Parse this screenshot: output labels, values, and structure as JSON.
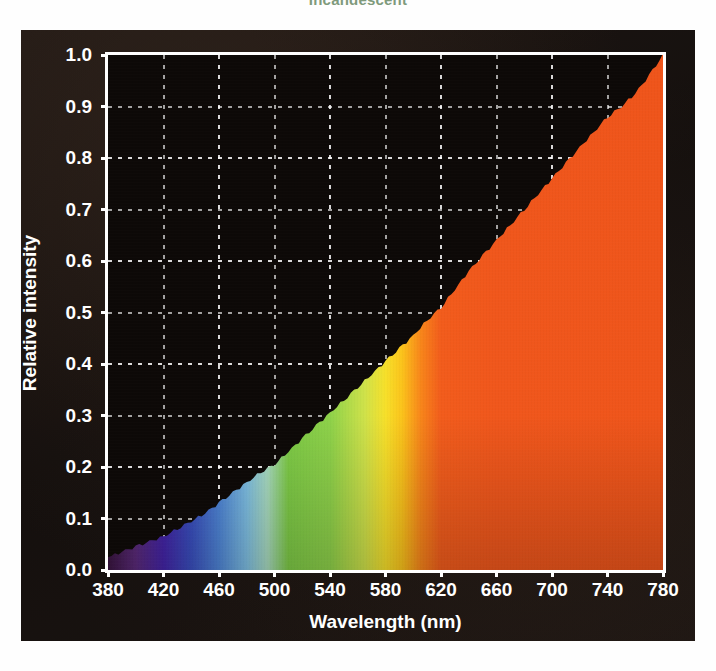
{
  "title": "Incandescent",
  "colors": {
    "panel_background": "#171210",
    "plot_background": "#0d0907",
    "axis": "#ffffff",
    "grid": "#ffffff",
    "title_text": "#7f9a7c",
    "orange_fill": "#F0571C"
  },
  "axes": {
    "x_label": "Wavelength (nm)",
    "y_label": "Relative intensity",
    "x_ticks": [
      380,
      420,
      460,
      500,
      540,
      580,
      620,
      660,
      700,
      740,
      780
    ],
    "y_ticks": [
      "0.0",
      "0.1",
      "0.2",
      "0.3",
      "0.4",
      "0.5",
      "0.6",
      "0.7",
      "0.8",
      "0.9",
      "1.0"
    ]
  },
  "chart_data": {
    "type": "area",
    "title": "Incandescent",
    "xlabel": "Wavelength (nm)",
    "ylabel": "Relative intensity",
    "xlim": [
      380,
      780
    ],
    "ylim": [
      0.0,
      1.0
    ],
    "grid": true,
    "legend": "none",
    "fill_style": "visible-spectrum-gradient",
    "x": [
      380,
      390,
      400,
      410,
      420,
      430,
      440,
      450,
      460,
      470,
      480,
      490,
      500,
      510,
      520,
      530,
      540,
      550,
      560,
      570,
      580,
      590,
      600,
      610,
      620,
      630,
      640,
      650,
      660,
      670,
      680,
      690,
      700,
      710,
      720,
      730,
      740,
      750,
      760,
      770,
      780
    ],
    "y": [
      0.025,
      0.035,
      0.045,
      0.055,
      0.065,
      0.08,
      0.095,
      0.11,
      0.13,
      0.15,
      0.17,
      0.19,
      0.205,
      0.23,
      0.255,
      0.28,
      0.305,
      0.33,
      0.355,
      0.38,
      0.405,
      0.43,
      0.455,
      0.485,
      0.51,
      0.545,
      0.58,
      0.61,
      0.64,
      0.67,
      0.7,
      0.73,
      0.76,
      0.79,
      0.82,
      0.85,
      0.88,
      0.9,
      0.925,
      0.96,
      1.0
    ],
    "spectrum_stops": [
      {
        "wavelength": 380,
        "color": "#3a1540"
      },
      {
        "wavelength": 400,
        "color": "#5b2a7a"
      },
      {
        "wavelength": 420,
        "color": "#4424a8"
      },
      {
        "wavelength": 440,
        "color": "#3a4fc0"
      },
      {
        "wavelength": 460,
        "color": "#4f86d8"
      },
      {
        "wavelength": 480,
        "color": "#7fc0e4"
      },
      {
        "wavelength": 495,
        "color": "#a9dcc0"
      },
      {
        "wavelength": 510,
        "color": "#7ecb46"
      },
      {
        "wavelength": 540,
        "color": "#8ed24a"
      },
      {
        "wavelength": 565,
        "color": "#cfe24a"
      },
      {
        "wavelength": 580,
        "color": "#f7e02a"
      },
      {
        "wavelength": 592,
        "color": "#fbc31b"
      },
      {
        "wavelength": 605,
        "color": "#f8871a"
      },
      {
        "wavelength": 620,
        "color": "#f25c1c"
      },
      {
        "wavelength": 660,
        "color": "#f0571c"
      },
      {
        "wavelength": 780,
        "color": "#ef551b"
      }
    ]
  }
}
